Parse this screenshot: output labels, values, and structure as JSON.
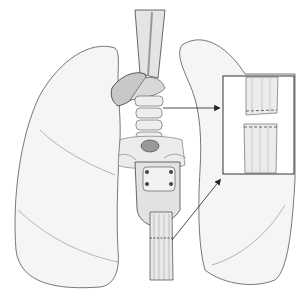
{
  "figure": {
    "colors": {
      "background": "#ffffff",
      "lung_fill": "#f4f4f4",
      "outline": "#444444",
      "tube_fill": "#e6e6e6",
      "shadow": "#b8b8b8",
      "dark": "#555555"
    },
    "inset": {
      "x": 223,
      "y": 76,
      "width": 71,
      "height": 98,
      "label": ""
    },
    "annotations": [
      {
        "type": "arrow",
        "from": [
          163,
          108
        ],
        "to": [
          221,
          108
        ]
      },
      {
        "type": "arrow",
        "from": [
          172,
          240
        ],
        "to": [
          222,
          178
        ]
      }
    ]
  }
}
